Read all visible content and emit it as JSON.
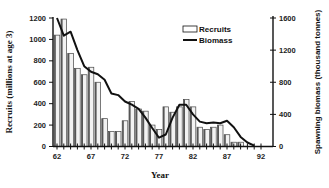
{
  "chart_data": {
    "type": "bar+line",
    "title": "",
    "xlabel": "Year",
    "ylabel": "Recruits (millions at age 3)",
    "ylabel_right": "Spawning biomass (thousand tonnes)",
    "x_ticks": [
      "62",
      "67",
      "72",
      "77",
      "82",
      "87",
      "92"
    ],
    "y_ticks_left": [
      "0",
      "200",
      "400",
      "600",
      "800",
      "1000",
      "1200"
    ],
    "y_ticks_right": [
      "0",
      "400",
      "800",
      "1200",
      "1600"
    ],
    "ylim": [
      0,
      1200
    ],
    "ylim_right": [
      0,
      1600
    ],
    "legend": [
      "Recruits",
      "Biomass"
    ],
    "legend_position": "upper right",
    "x": [
      62,
      63,
      64,
      65,
      66,
      67,
      68,
      69,
      70,
      71,
      72,
      73,
      74,
      75,
      76,
      77,
      78,
      79,
      80,
      81,
      82,
      83,
      84,
      85,
      86,
      87,
      88,
      89,
      90,
      91,
      92
    ],
    "series": [
      {
        "name": "Recruits",
        "type": "bar",
        "axis": "left",
        "values": [
          1040,
          1190,
          870,
          730,
          670,
          740,
          600,
          260,
          140,
          140,
          240,
          420,
          350,
          330,
          200,
          160,
          370,
          320,
          370,
          440,
          370,
          180,
          160,
          180,
          200,
          110,
          40,
          40,
          0,
          0,
          0
        ]
      },
      {
        "name": "Biomass",
        "type": "line",
        "axis": "right",
        "values": [
          1600,
          1380,
          1430,
          1200,
          1000,
          930,
          900,
          830,
          660,
          640,
          560,
          520,
          470,
          360,
          230,
          110,
          150,
          360,
          520,
          520,
          400,
          310,
          290,
          300,
          290,
          320,
          240,
          120,
          50,
          10,
          null
        ]
      }
    ]
  }
}
